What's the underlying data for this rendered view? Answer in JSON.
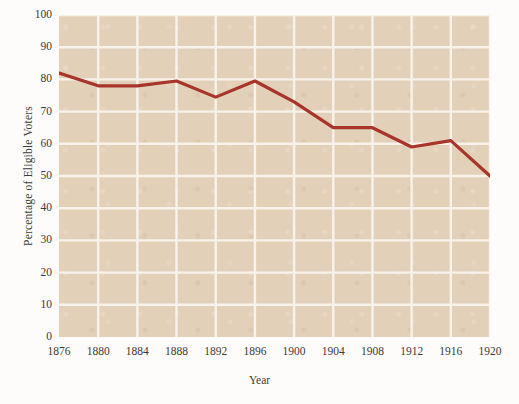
{
  "chart_data": {
    "type": "line",
    "title": "",
    "xlabel": "Year",
    "ylabel": "Percentage of Eligible Voters",
    "x": [
      1876,
      1880,
      1884,
      1888,
      1892,
      1896,
      1900,
      1904,
      1908,
      1912,
      1916,
      1920
    ],
    "xticklabels": [
      "1876",
      "1880",
      "1884",
      "1888",
      "1892",
      "1896",
      "1900",
      "1904",
      "1908",
      "1912",
      "1916",
      "1920"
    ],
    "values": [
      82,
      78,
      78,
      79.5,
      74.5,
      79.5,
      73,
      65,
      65,
      59,
      61,
      50
    ],
    "yticks": [
      0,
      10,
      20,
      30,
      40,
      50,
      60,
      70,
      80,
      90,
      100
    ],
    "yticklabels": [
      "0",
      "10",
      "20",
      "30",
      "40",
      "50",
      "60",
      "70",
      "80",
      "90",
      "100"
    ],
    "xlim": [
      1876,
      1920
    ],
    "ylim": [
      0,
      100
    ],
    "grid": true,
    "legend": null,
    "series": [
      {
        "name": "Percentage of Eligible Voters",
        "color": "#a8342a",
        "values": [
          82,
          78,
          78,
          79.5,
          74.5,
          79.5,
          73,
          65,
          65,
          59,
          61,
          50
        ]
      }
    ],
    "colors": {
      "line": "#a8342a",
      "plot_background": "#e3d0b9",
      "gridline": "#f7f2ea",
      "figure_background": "#fdfcfa",
      "tick_text": "#3b3835"
    }
  }
}
